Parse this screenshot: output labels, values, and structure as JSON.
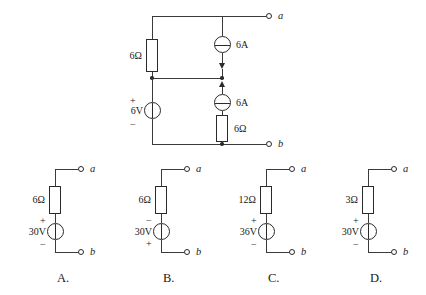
{
  "page": {
    "header_sliver": "▫ ▫ ▫ ▫ ▫ ▫",
    "width": 426,
    "height": 295,
    "ink_color": "#2a2a2a",
    "wire_color": "#3a3a3a",
    "background": "#ffffff"
  },
  "main_circuit": {
    "name": "two-terminal network with two 6A sources, two 6 ohm resistors and a 6V source",
    "terminals": [
      {
        "id": "a",
        "label": "a"
      },
      {
        "id": "b",
        "label": "b"
      }
    ],
    "components": [
      {
        "id": "r-left",
        "type": "resistor",
        "label": "6Ω",
        "value": "6",
        "unit": "Ω"
      },
      {
        "id": "i-top",
        "type": "current-source",
        "label": "6A",
        "value": "6",
        "unit": "A",
        "arrow": "down"
      },
      {
        "id": "v-mid",
        "type": "voltage-source",
        "label": "6V",
        "value": "6",
        "unit": "V",
        "plus": "+",
        "minus": "−"
      },
      {
        "id": "i-bottom",
        "type": "current-source",
        "label": "6A",
        "value": "6",
        "unit": "A",
        "arrow": "up"
      },
      {
        "id": "r-right",
        "type": "resistor",
        "label": "6Ω",
        "value": "6",
        "unit": "Ω"
      }
    ]
  },
  "options": [
    {
      "letter": "A.",
      "resistor": "6Ω",
      "source": "30V",
      "top_polarity": "+",
      "bottom_polarity": "−",
      "terminal_a": "a",
      "terminal_b": "b"
    },
    {
      "letter": "B.",
      "resistor": "6Ω",
      "source": "30V",
      "top_polarity": "−",
      "bottom_polarity": "+",
      "terminal_a": "a",
      "terminal_b": "b"
    },
    {
      "letter": "C.",
      "resistor": "12Ω",
      "source": "36V",
      "top_polarity": "+",
      "bottom_polarity": "−",
      "terminal_a": "a",
      "terminal_b": "b"
    },
    {
      "letter": "D.",
      "resistor": "3Ω",
      "source": "30V",
      "top_polarity": "+",
      "bottom_polarity": "−",
      "terminal_a": "a",
      "terminal_b": "b"
    }
  ]
}
